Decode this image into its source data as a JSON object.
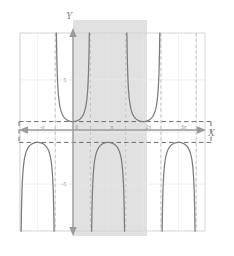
{
  "figure": {
    "title": "",
    "axis_labels": {
      "x": "X",
      "y": "Y"
    },
    "background": "#ffffff",
    "frame_color": "#d8d8d8",
    "grid_color": "#e9e3e3",
    "curve_color": "#7b7b7b",
    "asymptote_color": "#b9b9b9",
    "band_color": "#cfcfcf",
    "axis_color": "#9a9a9a",
    "dash_color": "#6f6f6f"
  },
  "chart_data": {
    "type": "line",
    "title": "",
    "xlabel": "X",
    "ylabel": "Y",
    "function": "y = sec(x)",
    "xlim": [
      -4.71238898038469,
      11.780972450961723
    ],
    "ylim": [
      -9.5,
      9.5
    ],
    "grid": true,
    "legend": null,
    "xticks": [
      -3.141592653589793,
      0,
      3.141592653589793,
      6.283185307179586,
      9.42477796076938
    ],
    "xticklabels": [
      "-π",
      "0",
      "π",
      "2π",
      "3π"
    ],
    "yticks": [
      5,
      -5
    ],
    "yticklabels": [
      "5",
      "-5"
    ],
    "asymptotes": {
      "label": "x = π/2 + kπ",
      "values": [
        -1.570796326794897,
        1.570796326794897,
        4.71238898038469,
        7.853981633974483,
        10.995574287564276
      ]
    },
    "horizontal_reference_lines": [
      1,
      -1
    ],
    "highlight_band": {
      "label": "principal period",
      "x_start": 0,
      "x_end": 6.283185307179586
    },
    "branches": [
      {
        "center": -3.141592653589793,
        "vertex_y": -1,
        "direction": "down"
      },
      {
        "center": 0,
        "vertex_y": 1,
        "direction": "up"
      },
      {
        "center": 3.141592653589793,
        "vertex_y": -1,
        "direction": "down"
      },
      {
        "center": 6.283185307179586,
        "vertex_y": 1,
        "direction": "up"
      },
      {
        "center": 9.42477796076938,
        "vertex_y": -1,
        "direction": "down"
      }
    ]
  }
}
